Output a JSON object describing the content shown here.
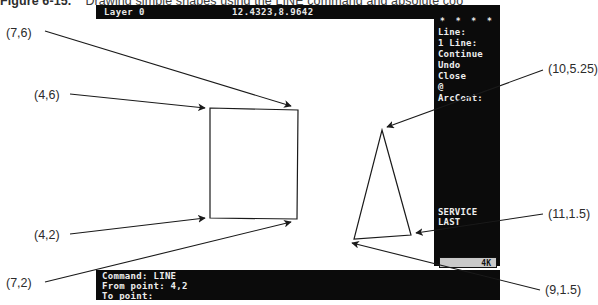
{
  "caption": {
    "figure_number": "Figure 6-15.",
    "text": "Drawing simple shapes using the LINE command and absolute coo"
  },
  "autocad": {
    "statusbar": {
      "layer": "Layer 0",
      "coordinates": "12.4323,8.9642",
      "brand": "ADDAutoCAD"
    },
    "side_menu": {
      "title": "ADDAutoCAD",
      "stars": "* * * *",
      "items": [
        "Line:",
        "",
        "1 Line:",
        "",
        "Continue",
        "Undo",
        "Close",
        "@",
        "",
        "ArcCont:"
      ],
      "footer_items": [
        "SERVICE",
        "LAST"
      ]
    },
    "memory_indicator": "4K",
    "command_window": {
      "lines": [
        "Command: LINE",
        "From point: 4,2",
        "To point:"
      ]
    }
  },
  "annotations": [
    {
      "id": "p76",
      "label": "(7,6)"
    },
    {
      "id": "p46",
      "label": "(4,6)"
    },
    {
      "id": "p42",
      "label": "(4,2)"
    },
    {
      "id": "p72",
      "label": "(7,2)"
    },
    {
      "id": "p10525",
      "label": "(10,5.25)"
    },
    {
      "id": "p1115",
      "label": "(11,1.5)"
    },
    {
      "id": "p915",
      "label": "(9,1.5)"
    }
  ],
  "colors": {
    "screen_background": "#0b0b0b",
    "screen_text": "#ededed",
    "canvas": "#ffffff",
    "ink": "#1a1a1a",
    "caption_text": "#3b3b3b"
  }
}
